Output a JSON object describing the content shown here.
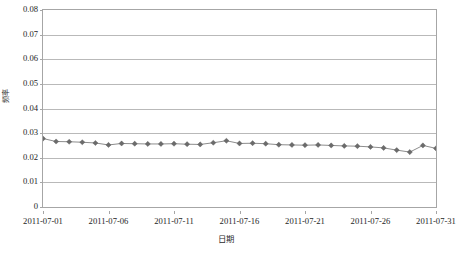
{
  "chart_data": {
    "type": "line",
    "title": "",
    "xlabel": "日期",
    "ylabel": "频率",
    "grid": true,
    "legend": false,
    "ylim": [
      0,
      0.08
    ],
    "ytick_labels": [
      "0.08",
      "0.07",
      "0.06",
      "0.05",
      "0.04",
      "0.03",
      "0.02",
      "0.01",
      "0"
    ],
    "ytick_values": [
      0.08,
      0.07,
      0.06,
      0.05,
      0.04,
      0.03,
      0.02,
      0.01,
      0
    ],
    "xtick_labels": [
      "2011-07-01",
      "2011-07-06",
      "2011-07-11",
      "2011-07-16",
      "2011-07-21",
      "2011-07-26",
      "2011-07-31"
    ],
    "xtick_values": [
      1,
      6,
      11,
      16,
      21,
      26,
      31
    ],
    "xlim": [
      1,
      31
    ],
    "marker": "diamond",
    "series": [
      {
        "name": "频率",
        "color": "#6b6b6b",
        "x": [
          1,
          2,
          3,
          4,
          5,
          6,
          7,
          8,
          9,
          10,
          11,
          12,
          13,
          14,
          15,
          16,
          17,
          18,
          19,
          20,
          21,
          22,
          23,
          24,
          25,
          26,
          27,
          28,
          29,
          30,
          31
        ],
        "values": [
          0.0278,
          0.0266,
          0.0265,
          0.0263,
          0.026,
          0.0252,
          0.0258,
          0.0257,
          0.0256,
          0.0256,
          0.0257,
          0.0255,
          0.0254,
          0.0261,
          0.0269,
          0.0258,
          0.0259,
          0.0257,
          0.0253,
          0.0252,
          0.0251,
          0.0252,
          0.025,
          0.0248,
          0.0247,
          0.0244,
          0.024,
          0.0231,
          0.0223,
          0.025,
          0.0238
        ]
      }
    ]
  }
}
